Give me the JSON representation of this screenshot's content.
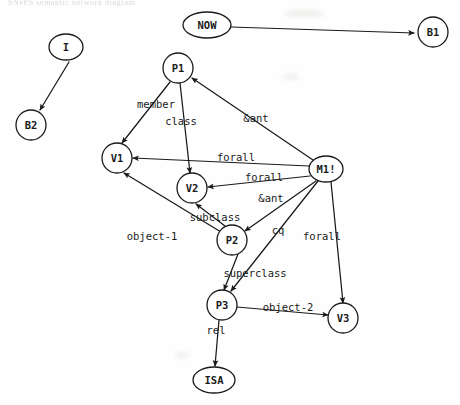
{
  "page": {
    "header_text": "SNePS semantic network diagram",
    "width": 460,
    "height": 405,
    "background": "#fefefe",
    "ink_color": "#1a1a1a"
  },
  "graph": {
    "type": "directed-graph",
    "node_shape_default": "circle",
    "nodes": [
      {
        "id": "NOW",
        "label": "NOW",
        "x": 207,
        "y": 25,
        "shape": "ellipse",
        "rx": 24,
        "ry": 13
      },
      {
        "id": "B1",
        "label": "B1",
        "x": 433,
        "y": 32,
        "shape": "circle",
        "rx": 15,
        "ry": 15
      },
      {
        "id": "I",
        "label": "I",
        "x": 66,
        "y": 47,
        "shape": "ellipse",
        "rx": 17,
        "ry": 13
      },
      {
        "id": "B2",
        "label": "B2",
        "x": 31,
        "y": 125,
        "shape": "circle",
        "rx": 15,
        "ry": 15
      },
      {
        "id": "P1",
        "label": "P1",
        "x": 178,
        "y": 68,
        "shape": "circle",
        "rx": 15,
        "ry": 15
      },
      {
        "id": "V1",
        "label": "V1",
        "x": 117,
        "y": 158,
        "shape": "circle",
        "rx": 15,
        "ry": 15
      },
      {
        "id": "M1",
        "label": "M1!",
        "x": 326,
        "y": 169,
        "shape": "ellipse",
        "rx": 17,
        "ry": 13
      },
      {
        "id": "V2",
        "label": "V2",
        "x": 192,
        "y": 188,
        "shape": "circle",
        "rx": 15,
        "ry": 15
      },
      {
        "id": "P2",
        "label": "P2",
        "x": 232,
        "y": 240,
        "shape": "circle",
        "rx": 15,
        "ry": 15
      },
      {
        "id": "P3",
        "label": "P3",
        "x": 222,
        "y": 305,
        "shape": "circle",
        "rx": 15,
        "ry": 15
      },
      {
        "id": "V3",
        "label": "V3",
        "x": 343,
        "y": 318,
        "shape": "circle",
        "rx": 15,
        "ry": 15
      },
      {
        "id": "ISA",
        "label": "ISA",
        "x": 214,
        "y": 380,
        "shape": "ellipse",
        "rx": 21,
        "ry": 13
      }
    ],
    "edges": [
      {
        "from": "NOW",
        "to": "B1",
        "label": "",
        "path": "M231,27 L414,33"
      },
      {
        "from": "I",
        "to": "B2",
        "label": "",
        "path": "M69,62 L40,110"
      },
      {
        "from": "P1",
        "to": "V1",
        "label": "member",
        "path": "M170,82 L122,143"
      },
      {
        "from": "P1",
        "to": "V2",
        "label": "class",
        "path": "M180,83 L190,173"
      },
      {
        "from": "M1",
        "to": "P1",
        "label": "&ant",
        "path": "M313,160 L192,78"
      },
      {
        "from": "M1",
        "to": "V1",
        "label": "forall",
        "path": "M309,166 L133,158"
      },
      {
        "from": "M1",
        "to": "V2",
        "label": "forall",
        "path": "M310,176 L208,187"
      },
      {
        "from": "M1",
        "to": "P2",
        "label": "&ant",
        "path": "M316,181 L245,231"
      },
      {
        "from": "M1",
        "to": "V3",
        "label": "forall",
        "path": "M331,182 L343,303"
      },
      {
        "from": "P2",
        "to": "V2",
        "label": "subclass",
        "path": "M225,226 L196,204"
      },
      {
        "from": "P2",
        "to": "V1",
        "label": "object-1",
        "path": "M221,232 L124,173"
      },
      {
        "from": "P2",
        "to": "P3",
        "label": "cq",
        "path": "M238,254 L224,290"
      },
      {
        "from": "P3",
        "to": "V3",
        "label": "object-2",
        "path": "M237,307 L328,315"
      },
      {
        "from": "P3",
        "to": "ISA",
        "label": "rel",
        "path": "M219,320 L215,366"
      },
      {
        "from": "M1",
        "to": "P3",
        "label": "superclass",
        "path": "M318,181 L231,291"
      }
    ],
    "edge_labels": [
      {
        "text": "member",
        "x": 156,
        "y": 108
      },
      {
        "text": "class",
        "x": 181,
        "y": 125
      },
      {
        "text": "&ant",
        "x": 256,
        "y": 122
      },
      {
        "text": "forall",
        "x": 236,
        "y": 161
      },
      {
        "text": "forall",
        "x": 264,
        "y": 181
      },
      {
        "text": "&ant",
        "x": 271,
        "y": 202
      },
      {
        "text": "subclass",
        "x": 215,
        "y": 221
      },
      {
        "text": "object-1",
        "x": 152,
        "y": 240
      },
      {
        "text": "cq",
        "x": 278,
        "y": 234
      },
      {
        "text": "forall",
        "x": 322,
        "y": 240
      },
      {
        "text": "superclass",
        "x": 255,
        "y": 277
      },
      {
        "text": "object-2",
        "x": 288,
        "y": 311
      },
      {
        "text": "rel",
        "x": 216,
        "y": 334
      }
    ]
  }
}
